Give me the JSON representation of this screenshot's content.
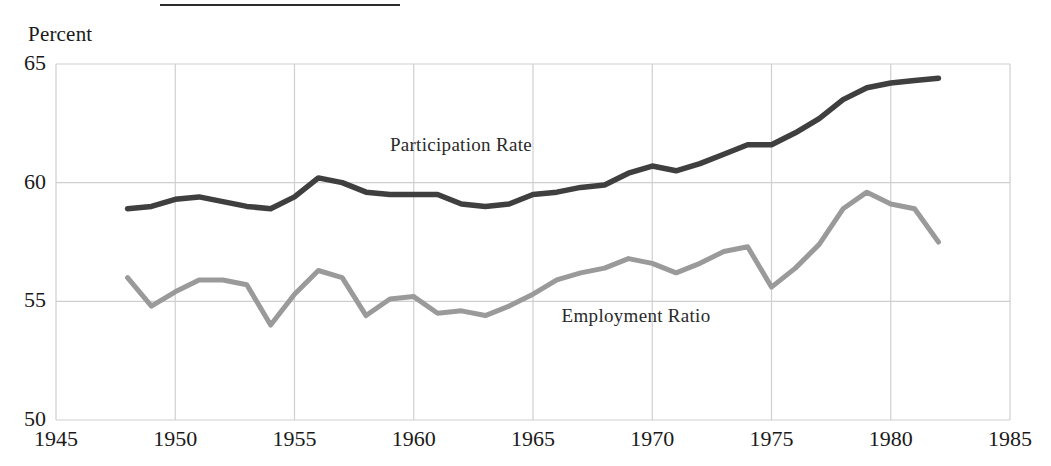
{
  "figure": {
    "unit_label": "Percent",
    "has_top_rule": true
  },
  "chart_data": {
    "type": "line",
    "title": "",
    "subtitle": "",
    "xlabel": "",
    "ylabel": "Percent",
    "xlim": [
      1945,
      1985
    ],
    "ylim": [
      50,
      65
    ],
    "grid": true,
    "grid_style": "light gray vertical and horizontal gridlines at ticks",
    "legend_position": "inline-labels",
    "x_ticks": [
      1945,
      1950,
      1955,
      1960,
      1965,
      1970,
      1975,
      1980,
      1985
    ],
    "x_tick_labels": [
      "1945",
      "1950",
      "1955",
      "1960",
      "1965",
      "1970",
      "1975",
      "1980",
      "1985"
    ],
    "y_ticks": [
      50,
      55,
      60,
      65
    ],
    "y_tick_labels": [
      "50",
      "55",
      "60",
      "65"
    ],
    "x": [
      1948,
      1949,
      1950,
      1951,
      1952,
      1953,
      1954,
      1955,
      1956,
      1957,
      1958,
      1959,
      1960,
      1961,
      1962,
      1963,
      1964,
      1965,
      1966,
      1967,
      1968,
      1969,
      1970,
      1971,
      1972,
      1973,
      1974,
      1975,
      1976,
      1977,
      1978,
      1979,
      1980,
      1981,
      1982
    ],
    "series": [
      {
        "name": "Participation Rate",
        "color": "#3f3f3f",
        "width": 5.5,
        "label_x": 1959.0,
        "label_y": 61.6,
        "values": [
          58.9,
          59.0,
          59.3,
          59.4,
          59.2,
          59.0,
          58.9,
          59.4,
          60.2,
          60.0,
          59.6,
          59.5,
          59.5,
          59.5,
          59.1,
          59.0,
          59.1,
          59.5,
          59.6,
          59.8,
          59.9,
          60.4,
          60.7,
          60.5,
          60.8,
          61.2,
          61.6,
          61.6,
          62.1,
          62.7,
          63.5,
          64.0,
          64.2,
          64.3,
          64.4
        ]
      },
      {
        "name": "Employment Ratio",
        "color": "#9a9a9a",
        "width": 5.0,
        "label_x": 1966.2,
        "label_y": 54.4,
        "values": [
          56.0,
          54.8,
          55.4,
          55.9,
          55.9,
          55.7,
          54.0,
          55.3,
          56.3,
          56.0,
          54.4,
          55.1,
          55.2,
          54.5,
          54.6,
          54.4,
          54.8,
          55.3,
          55.9,
          56.2,
          56.4,
          56.8,
          56.6,
          56.2,
          56.6,
          57.1,
          57.3,
          55.6,
          56.4,
          57.4,
          58.9,
          59.6,
          59.1,
          58.9,
          57.5
        ]
      }
    ]
  }
}
